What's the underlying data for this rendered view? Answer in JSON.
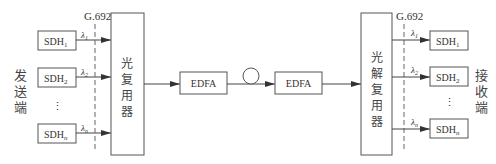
{
  "diagram": {
    "standard_label": "G.692",
    "transmit_end": {
      "label": "发送端",
      "chars": [
        "发",
        "送",
        "端"
      ],
      "sources": [
        {
          "name": "SDH",
          "sub": "1",
          "wavelength": "λ",
          "wsub": "1"
        },
        {
          "name": "SDH",
          "sub": "2",
          "wavelength": "λ",
          "wsub": "2"
        },
        {
          "name": "SDH",
          "sub": "n",
          "wavelength": "λ",
          "wsub": "n"
        }
      ],
      "ellipsis": "⋮"
    },
    "multiplexer": {
      "label": "光复用器",
      "chars": [
        "光",
        "复",
        "用",
        "器"
      ]
    },
    "amplifiers": [
      {
        "label": "EDFA"
      },
      {
        "label": "EDFA"
      }
    ],
    "fiber": {
      "icon": "fiber-loop-icon"
    },
    "demultiplexer": {
      "label": "光解复用器",
      "chars": [
        "光",
        "解",
        "复",
        "用",
        "器"
      ]
    },
    "receive_end": {
      "label": "接收端",
      "chars": [
        "接",
        "收",
        "端"
      ],
      "sinks": [
        {
          "name": "SDH",
          "sub": "1",
          "wavelength": "λ",
          "wsub": "1"
        },
        {
          "name": "SDH",
          "sub": "2",
          "wavelength": "λ",
          "wsub": "2"
        },
        {
          "name": "SDH",
          "sub": "n",
          "wavelength": "λ",
          "wsub": "n"
        }
      ],
      "ellipsis": "⋮"
    },
    "colors": {
      "line": "#555555",
      "text": "#333333",
      "background": "#ffffff"
    }
  }
}
